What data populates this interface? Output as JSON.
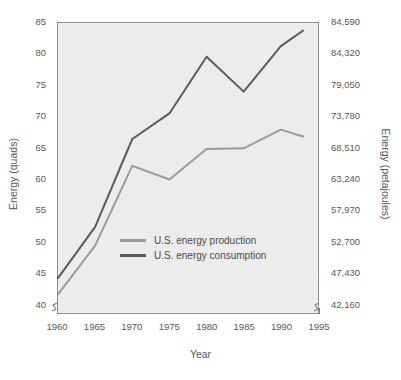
{
  "chart_data": {
    "type": "line",
    "title": "",
    "xlabel": "Year",
    "ylabel": "Energy (quads)",
    "ylabel_right": "Energy (petajoules)",
    "xlim": [
      1960,
      1995
    ],
    "ylim": [
      38.5,
      85
    ],
    "grid": false,
    "legend_position": "center",
    "axis_break": true,
    "x": [
      1960,
      1965,
      1970,
      1975,
      1980,
      1985,
      1990,
      1993
    ],
    "xticks": [
      "1960",
      "1965",
      "1970",
      "1975",
      "1980",
      "1985",
      "1990",
      "1995"
    ],
    "xtick_values": [
      1960,
      1965,
      1970,
      1975,
      1980,
      1985,
      1990,
      1995
    ],
    "yticks": [
      "40",
      "45",
      "50",
      "55",
      "60",
      "65",
      "70",
      "75",
      "80",
      "85"
    ],
    "ytick_values": [
      40,
      45,
      50,
      55,
      60,
      65,
      70,
      75,
      80,
      85
    ],
    "yticks_right": [
      "42,160",
      "47,430",
      "52,700",
      "57,970",
      "63,240",
      "68,510",
      "73,780",
      "79,050",
      "84,320",
      "84,590"
    ],
    "series": [
      {
        "name": "U.S. energy production",
        "color": "#9a9a9a",
        "values": [
          41.5,
          49.3,
          62.1,
          59.9,
          64.8,
          64.9,
          67.9,
          66.8
        ]
      },
      {
        "name": "U.S. energy consumption",
        "color": "#5a5a5c",
        "values": [
          44.1,
          52.3,
          66.4,
          70.5,
          79.6,
          74.0,
          81.3,
          83.8
        ]
      }
    ]
  },
  "legend": {
    "items": [
      {
        "label": "U.S. energy production",
        "color": "#9a9a9a"
      },
      {
        "label": "U.S. energy consumption",
        "color": "#5a5a5c"
      }
    ]
  },
  "style": {
    "plot_background": "#ececec",
    "page_background": "#ffffff",
    "axis_color": "#8c8c8c",
    "text_color": "#58585a"
  }
}
